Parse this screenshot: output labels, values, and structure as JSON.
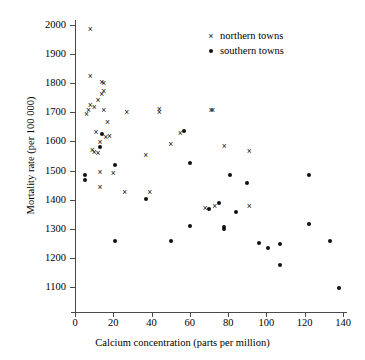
{
  "chart_data": {
    "type": "scatter",
    "title": "",
    "xlabel": "Calcium concentration (parts per million)",
    "ylabel": "Mortality rate (per 100 000)",
    "xlim": [
      0,
      145
    ],
    "ylim": [
      1060,
      2020
    ],
    "xticks": [
      0,
      20,
      40,
      60,
      80,
      100,
      120,
      140
    ],
    "yticks": [
      1100,
      1200,
      1300,
      1400,
      1500,
      1600,
      1700,
      1800,
      1900,
      2000
    ],
    "grid": false,
    "legend_position": "top-right",
    "marker_color": "#111111",
    "axis_color": "#4a4a4a",
    "series": [
      {
        "name": "northern towns",
        "marker": "x",
        "points": [
          [
            8,
            1985
          ],
          [
            8,
            1823
          ],
          [
            14,
            1802
          ],
          [
            15,
            1798
          ],
          [
            8,
            1724
          ],
          [
            10,
            1718
          ],
          [
            12,
            1742
          ],
          [
            14,
            1760
          ],
          [
            15,
            1772
          ],
          [
            6,
            1693
          ],
          [
            7,
            1707
          ],
          [
            15,
            1707
          ],
          [
            27,
            1700
          ],
          [
            44,
            1709
          ],
          [
            44,
            1700
          ],
          [
            71,
            1707
          ],
          [
            72,
            1706
          ],
          [
            17,
            1665
          ],
          [
            11,
            1632
          ],
          [
            55,
            1627
          ],
          [
            50,
            1589
          ],
          [
            78,
            1583
          ],
          [
            91,
            1566
          ],
          [
            16,
            1612
          ],
          [
            18,
            1618
          ],
          [
            13,
            1598
          ],
          [
            9,
            1570
          ],
          [
            10,
            1562
          ],
          [
            12,
            1560
          ],
          [
            37,
            1551
          ],
          [
            13,
            1494
          ],
          [
            20,
            1490
          ],
          [
            13,
            1441
          ],
          [
            26,
            1423
          ],
          [
            39,
            1424
          ],
          [
            91,
            1376
          ],
          [
            73,
            1378
          ],
          [
            68,
            1371
          ]
        ]
      },
      {
        "name": "southern towns",
        "marker": "dot",
        "points": [
          [
            5,
            1486
          ],
          [
            5,
            1466
          ],
          [
            14,
            1625
          ],
          [
            13,
            1580
          ],
          [
            21,
            1519
          ],
          [
            60,
            1527
          ],
          [
            57,
            1637
          ],
          [
            81,
            1484
          ],
          [
            122,
            1485
          ],
          [
            90,
            1456
          ],
          [
            37,
            1402
          ],
          [
            75,
            1390
          ],
          [
            84,
            1359
          ],
          [
            70,
            1369
          ],
          [
            60,
            1308
          ],
          [
            78,
            1305
          ],
          [
            78,
            1300
          ],
          [
            122,
            1316
          ],
          [
            21,
            1257
          ],
          [
            50,
            1257
          ],
          [
            96,
            1252
          ],
          [
            101,
            1235
          ],
          [
            107,
            1246
          ],
          [
            133,
            1258
          ],
          [
            107,
            1174
          ],
          [
            138,
            1096
          ]
        ]
      }
    ]
  },
  "legend": {
    "items": [
      {
        "label": "northern towns",
        "marker": "x"
      },
      {
        "label": "southern towns",
        "marker": "dot"
      }
    ]
  }
}
